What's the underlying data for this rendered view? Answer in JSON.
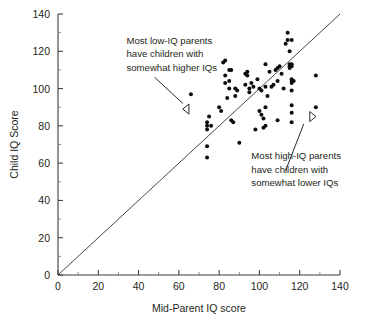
{
  "chart_data": {
    "type": "scatter",
    "title": "",
    "xlabel": "Mid-Parent IQ score",
    "ylabel": "Child IQ Score",
    "xlim": [
      0,
      140
    ],
    "ylim": [
      0,
      140
    ],
    "xticks": [
      0,
      20,
      40,
      60,
      80,
      100,
      120,
      140
    ],
    "yticks": [
      0,
      20,
      40,
      60,
      80,
      100,
      120,
      140
    ],
    "xtick_labels": [
      "0",
      "20",
      "40",
      "60",
      "80",
      "100",
      "120",
      "140"
    ],
    "ytick_labels": [
      "0",
      "20",
      "40",
      "60",
      "80",
      "100",
      "120",
      "140"
    ],
    "x_minor_tick_step": 10,
    "y_minor_tick_step": 10,
    "grid": false,
    "legend": null,
    "reference_line": {
      "name": "identity-line",
      "description": "y = x diagonal",
      "from": [
        0,
        0
      ],
      "to": [
        140,
        140
      ]
    },
    "series": [
      {
        "name": "parent-child IQ pairs",
        "marker": "filled-circle",
        "color": "#0d0d0d",
        "points": [
          [
            66,
            97
          ],
          [
            74,
            80
          ],
          [
            74,
            78
          ],
          [
            74,
            82
          ],
          [
            74,
            69
          ],
          [
            74,
            63
          ],
          [
            75,
            85
          ],
          [
            76,
            80
          ],
          [
            80,
            90
          ],
          [
            81,
            88
          ],
          [
            82,
            114
          ],
          [
            83,
            115
          ],
          [
            83,
            107
          ],
          [
            83,
            103
          ],
          [
            84,
            95
          ],
          [
            85,
            110
          ],
          [
            86,
            110
          ],
          [
            85,
            104
          ],
          [
            85,
            100
          ],
          [
            86,
            83
          ],
          [
            87,
            82
          ],
          [
            88,
            96
          ],
          [
            88,
            100
          ],
          [
            89,
            99
          ],
          [
            90,
            71
          ],
          [
            93,
            108
          ],
          [
            93,
            102
          ],
          [
            94,
            107
          ],
          [
            94,
            109
          ],
          [
            95,
            100
          ],
          [
            95,
            98
          ],
          [
            96,
            103
          ],
          [
            97,
            101
          ],
          [
            98,
            78
          ],
          [
            99,
            105
          ],
          [
            100,
            100
          ],
          [
            100,
            88
          ],
          [
            101,
            99
          ],
          [
            101,
            86
          ],
          [
            102,
            84
          ],
          [
            102,
            79
          ],
          [
            103,
            113
          ],
          [
            103,
            101
          ],
          [
            103,
            90
          ],
          [
            103,
            80
          ],
          [
            104,
            96
          ],
          [
            105,
            109
          ],
          [
            106,
            101
          ],
          [
            107,
            102
          ],
          [
            108,
            110
          ],
          [
            109,
            111
          ],
          [
            109,
            104
          ],
          [
            109,
            83
          ],
          [
            110,
            112
          ],
          [
            111,
            108
          ],
          [
            112,
            100
          ],
          [
            113,
            124
          ],
          [
            114,
            126
          ],
          [
            114,
            130
          ],
          [
            115,
            120
          ],
          [
            115,
            113
          ],
          [
            115,
            112
          ],
          [
            115,
            111
          ],
          [
            116,
            126
          ],
          [
            116,
            113
          ],
          [
            116,
            112
          ],
          [
            116,
            105
          ],
          [
            116,
            104
          ],
          [
            116,
            103
          ],
          [
            116,
            99
          ],
          [
            116,
            91
          ],
          [
            116,
            87
          ],
          [
            116,
            82
          ],
          [
            117,
            104
          ],
          [
            128,
            107
          ],
          [
            128,
            90
          ]
        ]
      }
    ],
    "annotations": [
      {
        "name": "low-iq-annotation",
        "lines": [
          "Most low-IQ parents",
          "have children with",
          "somewhat higher IQs"
        ],
        "text_anchor": [
          34,
          124
        ],
        "arrow_from": [
          48,
          106
        ],
        "arrow_to": [
          62,
          92
        ],
        "marker": "open-triangle-left",
        "marker_at": [
          65,
          89
        ]
      },
      {
        "name": "high-iq-annotation",
        "lines": [
          "Most high-IQ parents",
          "have children with",
          "somewhat lower IQs"
        ],
        "text_anchor": [
          96,
          62
        ],
        "arrow_from": [
          113,
          56
        ],
        "arrow_to": [
          122,
          81
        ],
        "marker": "open-triangle-right",
        "marker_at": [
          125,
          85
        ]
      }
    ]
  }
}
